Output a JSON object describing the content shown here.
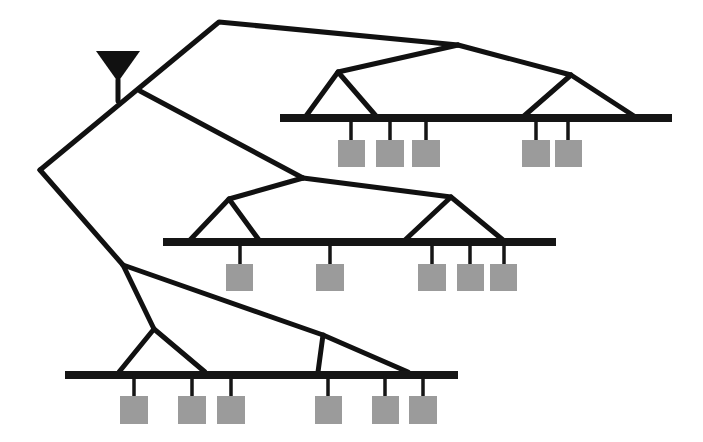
{
  "diagram": {
    "type": "hierarchical-network-tree",
    "colors": {
      "lines": "#111111",
      "bus": "#151515",
      "leaf": "#9b9b9b",
      "background": "#ffffff"
    },
    "root": {
      "icon": "antenna-icon",
      "x": 118,
      "y": 51
    },
    "buses": [
      {
        "name": "top-bus",
        "x1": 280,
        "x2": 672,
        "y": 118,
        "leaf_xs": [
          351,
          390,
          426,
          536,
          568
        ]
      },
      {
        "name": "middle-bus",
        "x1": 163,
        "x2": 556,
        "y": 242,
        "leaf_xs": [
          240,
          330,
          432,
          470,
          504
        ]
      },
      {
        "name": "bottom-bus",
        "x1": 65,
        "x2": 458,
        "y": 375,
        "leaf_xs": [
          134,
          192,
          231,
          328,
          385,
          423
        ]
      }
    ],
    "leaf_count": 16
  }
}
